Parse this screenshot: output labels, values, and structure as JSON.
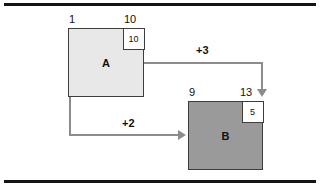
{
  "figure": {
    "background_color": "#ffffff",
    "rule_color": "#141414",
    "connector_color": "#8c8c8c"
  },
  "nodes": [
    {
      "id": "A",
      "label": "A",
      "fill_color": "#e8e8e8",
      "border_color": "#3d3d3d",
      "left_index": "1",
      "right_index": "10",
      "subbox_value": "10"
    },
    {
      "id": "B",
      "label": "B",
      "fill_color": "#9a9a9a",
      "border_color": "#3d3d3d",
      "left_index": "9",
      "right_index": "13",
      "subbox_value": "5"
    }
  ],
  "edges": [
    {
      "id": "a-to-b-top",
      "label": "+3",
      "weight": 3,
      "from": "A",
      "to": "B",
      "from_side": "right",
      "to_side": "top",
      "color": "#8c8c8c",
      "arrow_direction": "down"
    },
    {
      "id": "a-to-b-bottom",
      "label": "+2",
      "weight": 2,
      "from": "A",
      "to": "B",
      "from_side": "bottom-left",
      "to_side": "left",
      "color": "#8c8c8c",
      "arrow_direction": "right"
    }
  ]
}
